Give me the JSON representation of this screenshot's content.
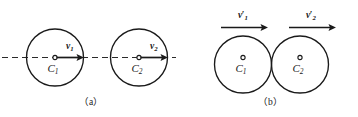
{
  "figure": {
    "stroke_color": "#1a1a1a",
    "background_color": "#ffffff",
    "panels": [
      {
        "id": "a",
        "caption": "（a）",
        "axis": {
          "type": "dashed-centerline",
          "visible": true
        },
        "bodies": [
          {
            "center_label": "C",
            "center_subscript": "1",
            "velocity_symbol": "v",
            "velocity_subscript": "1",
            "velocity_prime": "",
            "arrow_direction": "right",
            "arrow_origin": "center"
          },
          {
            "center_label": "C",
            "center_subscript": "2",
            "velocity_symbol": "v",
            "velocity_subscript": "2",
            "velocity_prime": "",
            "arrow_direction": "right",
            "arrow_origin": "center"
          }
        ]
      },
      {
        "id": "b",
        "caption": "（b）",
        "axis": {
          "type": "none",
          "visible": false
        },
        "bodies": [
          {
            "center_label": "C",
            "center_subscript": "1",
            "velocity_symbol": "v",
            "velocity_subscript": "1",
            "velocity_prime": "′",
            "arrow_direction": "right",
            "arrow_origin": "above"
          },
          {
            "center_label": "C",
            "center_subscript": "2",
            "velocity_symbol": "v",
            "velocity_subscript": "2",
            "velocity_prime": "′",
            "arrow_direction": "right",
            "arrow_origin": "above"
          }
        ]
      }
    ]
  },
  "labels": {
    "a_v1": "v",
    "a_v1_sub": "1",
    "a_v2": "v",
    "a_v2_sub": "2",
    "a_c1": "C",
    "a_c1_sub": "1",
    "a_c2": "C",
    "a_c2_sub": "2",
    "a_caption": "（a）",
    "b_v1": "v",
    "b_v1_prime": "′",
    "b_v1_sub": "1",
    "b_v2": "v",
    "b_v2_prime": "′",
    "b_v2_sub": "2",
    "b_c1": "C",
    "b_c1_sub": "1",
    "b_c2": "C",
    "b_c2_sub": "2",
    "b_caption": "（b）"
  }
}
